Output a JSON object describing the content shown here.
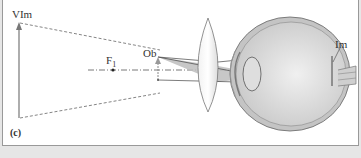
{
  "diagram": {
    "panel_label": "(c)",
    "labels": {
      "virtual_image": "VIm",
      "focal_point": "F",
      "focal_subscript": "1",
      "object": "Ob",
      "image": "Im"
    },
    "colors": {
      "background": "#ffffff",
      "outer_background": "#e6e6e6",
      "ray_shade": "#b8b8b8",
      "line": "#555555",
      "eye_fill": "#d9d9d9"
    }
  }
}
